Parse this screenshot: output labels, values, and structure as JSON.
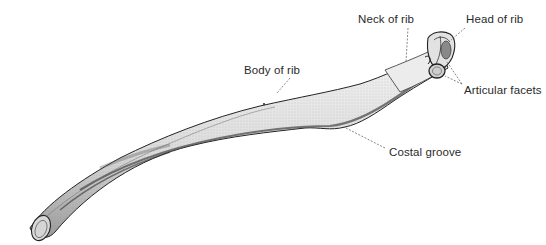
{
  "figure": {
    "labels": {
      "neck": "Neck of rib",
      "head": "Head of rib",
      "body": "Body of rib",
      "facets": "Articular facets",
      "groove": "Costal groove"
    },
    "caption": "",
    "colors": {
      "text": "#2a2a2a",
      "leader": "#555555",
      "bone_outline": "#222222",
      "bone_fill": "#e9e9e9",
      "bone_shade": "#8a8a8a"
    }
  }
}
